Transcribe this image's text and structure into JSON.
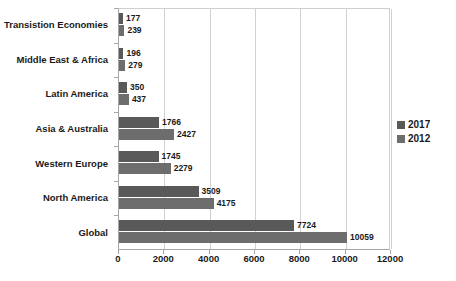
{
  "chart_data": {
    "type": "bar",
    "orientation": "horizontal",
    "title": "",
    "subtitle": "",
    "xlabel": "",
    "ylabel": "",
    "xlim": [
      0,
      12000
    ],
    "xticks": [
      0,
      2000,
      4000,
      6000,
      8000,
      10000,
      12000
    ],
    "xtick_labels": [
      "0",
      "2000",
      "4000",
      "6000",
      "8000",
      "10000",
      "12000"
    ],
    "grid": true,
    "grid_axis": "x",
    "legend_position": "right",
    "categories": [
      "Transistion Economies",
      "Middle East & Africa",
      "Latin America",
      "Asia & Australia",
      "Western Europe",
      "North America",
      "Global"
    ],
    "series": [
      {
        "name": "2017",
        "color": "#595959",
        "values": [
          177,
          196,
          350,
          1766,
          1745,
          3509,
          7724
        ],
        "value_labels": [
          "177",
          "196",
          "350",
          "1766",
          "1745",
          "3509",
          "7724"
        ]
      },
      {
        "name": "2012",
        "color": "#6d6d6d",
        "values": [
          239,
          279,
          437,
          2427,
          2279,
          4175,
          10059
        ],
        "value_labels": [
          "239",
          "279",
          "437",
          "2427",
          "2279",
          "4175",
          "10059"
        ]
      }
    ],
    "legend": [
      {
        "label": "2017",
        "color": "#595959"
      },
      {
        "label": "2012",
        "color": "#6d6d6d"
      }
    ],
    "colors": {
      "series_2017": "#595959",
      "series_2012": "#6d6d6d",
      "gridline": "#d0d0d0",
      "axis": "#a6a6a6",
      "text": "#1a1a1a",
      "background": "#ffffff"
    }
  }
}
